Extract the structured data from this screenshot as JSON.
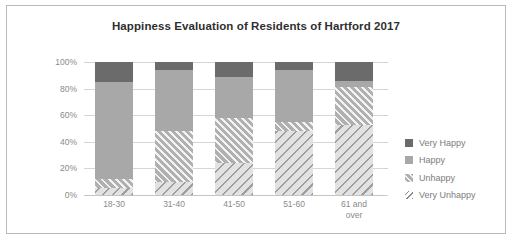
{
  "chart_data": {
    "type": "bar",
    "title": "Happiness Evaluation of Residents of Hartford 2017",
    "xlabel": "",
    "ylabel": "",
    "ylim": [
      0,
      100
    ],
    "stacked": true,
    "normalized_percent": true,
    "grid": true,
    "legend_position": "right",
    "categories": [
      "18-30",
      "31-40",
      "41-50",
      "51-60",
      "61 and over"
    ],
    "ytick_labels": [
      "0%",
      "20%",
      "40%",
      "60%",
      "80%",
      "100%"
    ],
    "ytick_values": [
      0,
      20,
      40,
      60,
      80,
      100
    ],
    "series": [
      {
        "name": "Very Unhappy",
        "values": [
          5,
          10,
          24,
          48,
          53
        ]
      },
      {
        "name": "Unhappy",
        "values": [
          7,
          38,
          34,
          7,
          28
        ]
      },
      {
        "name": "Happy",
        "values": [
          73,
          46,
          31,
          39,
          5
        ]
      },
      {
        "name": "Very Happy",
        "values": [
          15,
          6,
          11,
          6,
          14
        ]
      }
    ]
  },
  "legend": {
    "items": [
      {
        "label": "Very Happy",
        "swatch": "vh"
      },
      {
        "label": "Happy",
        "swatch": "h"
      },
      {
        "label": "Unhappy",
        "swatch": "u"
      },
      {
        "label": "Very Unhappy",
        "swatch": "vu"
      }
    ]
  },
  "colors": {
    "very_happy": "#6b6b6b",
    "happy": "#a8a8a8",
    "unhappy": "#b0b0b0",
    "very_unhappy": "#e2e2e2",
    "gridline": "#d6d6d6",
    "text": "#8a8a8a",
    "title": "#2f2f2f",
    "border": "#b9b9b9"
  }
}
